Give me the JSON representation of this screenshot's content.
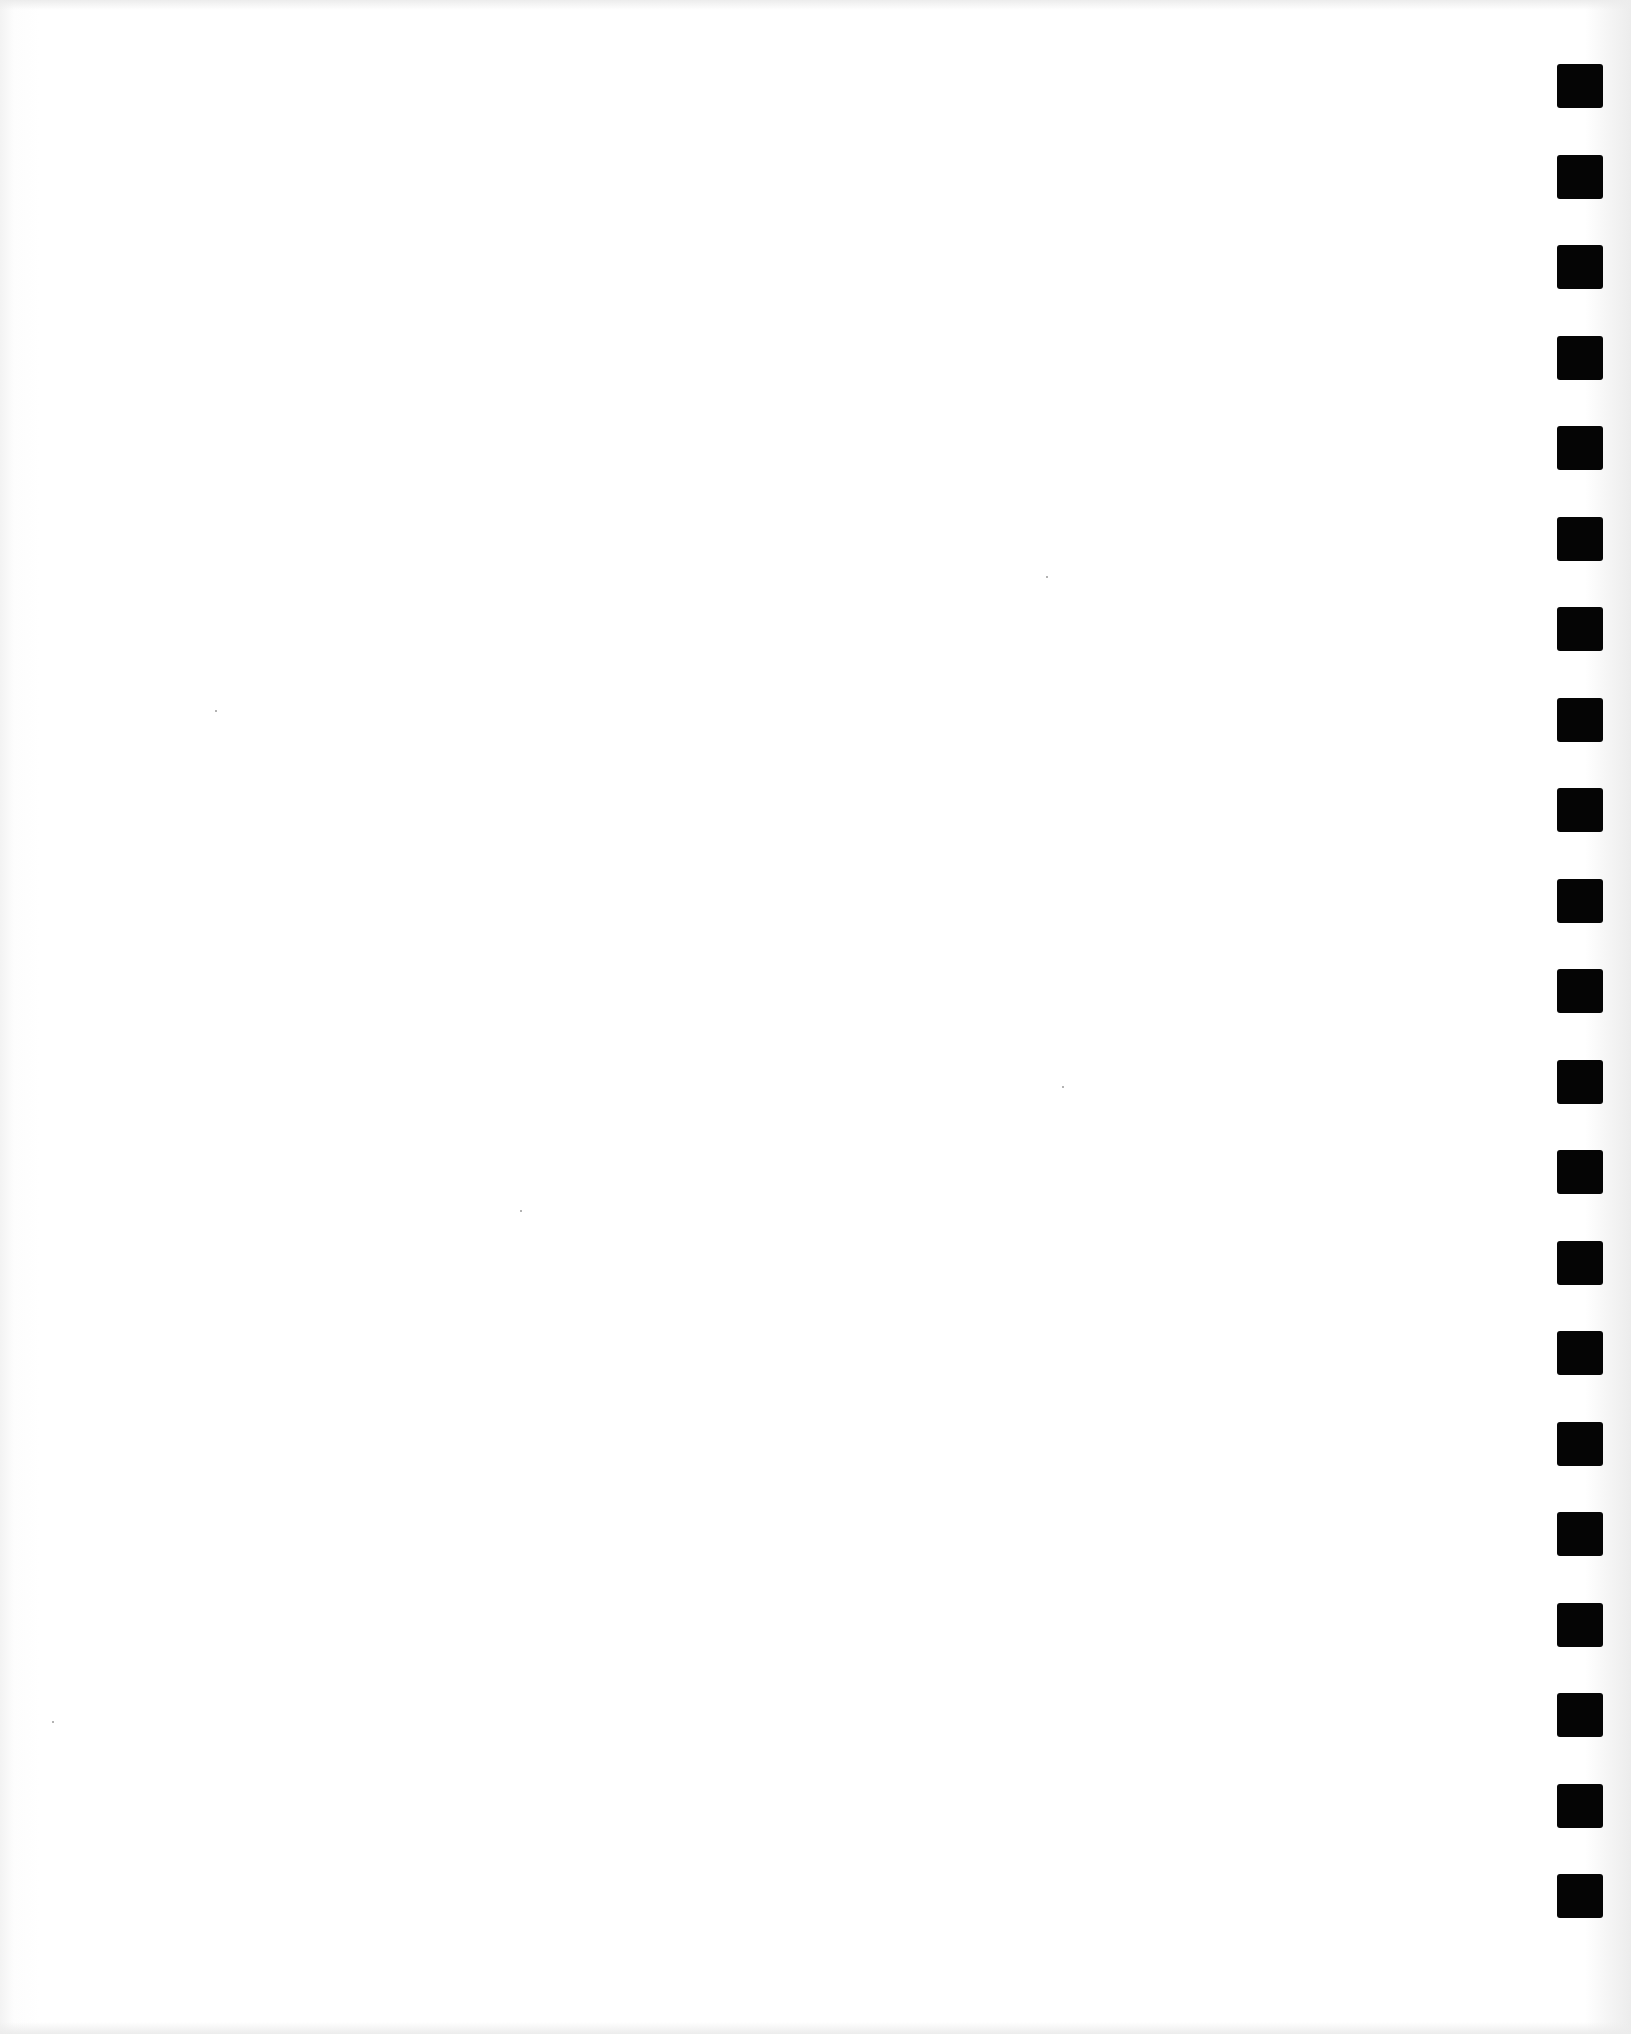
{
  "page": {
    "type": "blank scanned sheet",
    "text": "",
    "background_color": "#ffffff"
  },
  "binding_holes": {
    "side": "right",
    "count": 21,
    "color": "#050505",
    "first_top_px": 64,
    "spacing_px": 90.5
  }
}
